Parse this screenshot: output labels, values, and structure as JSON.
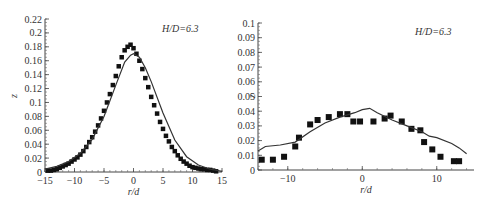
{
  "chart_data": [
    {
      "type": "scatter",
      "title": "",
      "annotation": "H/D=6.3",
      "xlabel": "r/d",
      "ylabel": "z",
      "xlim": [
        -15,
        15
      ],
      "ylim": [
        0,
        0.22
      ],
      "xticks": [
        -15,
        -10,
        -5,
        0,
        5,
        10,
        15
      ],
      "xtick_labels": [
        "−15",
        "−10",
        "−5",
        "0",
        "5",
        "10",
        "15"
      ],
      "yticks": [
        0,
        0.02,
        0.04,
        0.06,
        0.08,
        0.1,
        0.12,
        0.14,
        0.16,
        0.18,
        0.2,
        0.22
      ],
      "ytick_labels": [
        "0",
        "0.02",
        "0.04",
        "0.06",
        "0.08",
        "0.1",
        "0.12",
        "0.14",
        "0.16",
        "0.18",
        "0.2",
        "0.22"
      ],
      "grid": false,
      "series": [
        {
          "name": "measured",
          "style": "square-markers",
          "x": [
            -14.5,
            -14,
            -13.5,
            -13,
            -12.5,
            -12,
            -11.5,
            -11,
            -10.5,
            -10,
            -9.5,
            -9,
            -8.5,
            -8,
            -7.5,
            -7,
            -6.5,
            -6,
            -5.5,
            -5,
            -4.5,
            -4,
            -3.5,
            -3,
            -2.5,
            -2,
            -1.5,
            -1,
            -0.5,
            0,
            0.5,
            1,
            1.5,
            2,
            2.5,
            3,
            3.5,
            4,
            4.5,
            5,
            5.5,
            6,
            6.5,
            7,
            7.5,
            8,
            8.5,
            9,
            9.5,
            10,
            10.5,
            11,
            11.5,
            12,
            12.5,
            13,
            13.5,
            14
          ],
          "y": [
            0.002,
            0.002,
            0.003,
            0.004,
            0.006,
            0.008,
            0.01,
            0.012,
            0.015,
            0.018,
            0.021,
            0.025,
            0.03,
            0.036,
            0.043,
            0.05,
            0.058,
            0.067,
            0.077,
            0.088,
            0.1,
            0.112,
            0.125,
            0.138,
            0.152,
            0.165,
            0.175,
            0.18,
            0.183,
            0.178,
            0.17,
            0.16,
            0.148,
            0.135,
            0.122,
            0.108,
            0.096,
            0.084,
            0.072,
            0.062,
            0.052,
            0.044,
            0.036,
            0.03,
            0.024,
            0.019,
            0.015,
            0.012,
            0.009,
            0.007,
            0.006,
            0.005,
            0.004,
            0.004,
            0.003,
            0.003,
            0.002,
            0.001
          ]
        },
        {
          "name": "simulated",
          "style": "line",
          "x": [
            -15,
            -13,
            -11,
            -9,
            -7,
            -5,
            -3,
            -1.5,
            -0.5,
            0,
            1,
            2,
            3,
            5,
            7,
            9,
            11,
            13,
            15
          ],
          "y": [
            0.004,
            0.008,
            0.015,
            0.027,
            0.047,
            0.08,
            0.125,
            0.158,
            0.168,
            0.17,
            0.165,
            0.15,
            0.13,
            0.085,
            0.046,
            0.022,
            0.01,
            0.004,
            0.001
          ]
        }
      ]
    },
    {
      "type": "scatter",
      "title": "",
      "annotation": "H/D=6.3",
      "xlabel": "r/d",
      "ylabel": "z",
      "xlim": [
        -14,
        15
      ],
      "ylim": [
        0,
        0.1
      ],
      "xticks": [
        -10,
        0,
        10
      ],
      "xtick_labels": [
        "−10",
        "0",
        "10"
      ],
      "yticks": [
        0,
        0.01,
        0.02,
        0.03,
        0.04,
        0.05,
        0.06,
        0.07,
        0.08,
        0.09,
        0.1
      ],
      "ytick_labels": [
        "0",
        "0.01",
        "0.02",
        "0.03",
        "0.04",
        "0.05",
        "0.06",
        "0.07",
        "0.08",
        "0.09",
        "0.1"
      ],
      "grid": false,
      "series": [
        {
          "name": "measured",
          "style": "square-markers",
          "x": [
            -13.5,
            -12,
            -10.5,
            -9,
            -8.5,
            -7,
            -6,
            -4.5,
            -3,
            -2,
            -1.2,
            -0.3,
            1.5,
            3,
            3.8,
            5.3,
            6.6,
            7.8,
            8.3,
            9.4,
            10.5,
            12.3,
            13
          ],
          "y": [
            0.007,
            0.007,
            0.009,
            0.016,
            0.022,
            0.031,
            0.034,
            0.036,
            0.038,
            0.038,
            0.033,
            0.033,
            0.033,
            0.035,
            0.037,
            0.033,
            0.028,
            0.027,
            0.019,
            0.014,
            0.009,
            0.006,
            0.006
          ]
        },
        {
          "name": "simulated",
          "style": "line",
          "x": [
            -14,
            -13,
            -11,
            -9,
            -7,
            -5,
            -3,
            -1,
            0,
            1,
            2,
            4,
            6,
            8,
            9,
            10,
            12,
            13,
            14
          ],
          "y": [
            0.013,
            0.016,
            0.017,
            0.019,
            0.026,
            0.032,
            0.036,
            0.039,
            0.041,
            0.042,
            0.039,
            0.034,
            0.03,
            0.026,
            0.023,
            0.022,
            0.018,
            0.015,
            0.011
          ]
        }
      ]
    }
  ]
}
